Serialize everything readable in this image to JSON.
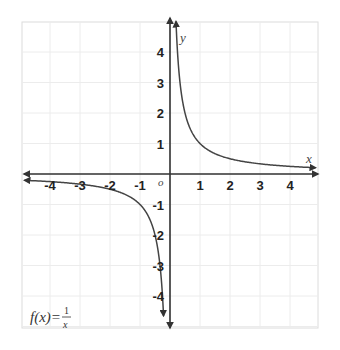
{
  "chart_data": {
    "type": "line",
    "title": "",
    "function_label": {
      "lhs": "f(x)=",
      "numerator": "1",
      "denominator": "x"
    },
    "xlabel": "x",
    "ylabel": "y",
    "origin_label": "o",
    "xlim": [
      -5,
      5
    ],
    "ylim": [
      -5,
      5
    ],
    "grid": true,
    "x_ticks": [
      -4,
      -3,
      -2,
      -1,
      1,
      2,
      3,
      4
    ],
    "y_ticks": [
      4,
      3,
      2,
      1,
      -1,
      -2,
      -3,
      -4
    ],
    "series": [
      {
        "name": "f(x)=1/x (x>0)",
        "x": [
          0.2,
          0.25,
          0.33,
          0.5,
          0.75,
          1,
          1.5,
          2,
          3,
          4,
          4.8
        ],
        "y": [
          5,
          4,
          3,
          2,
          1.33,
          1,
          0.67,
          0.5,
          0.33,
          0.25,
          0.21
        ]
      },
      {
        "name": "f(x)=1/x (x<0)",
        "x": [
          -4.8,
          -4,
          -3,
          -2,
          -1.5,
          -1,
          -0.75,
          -0.5,
          -0.33,
          -0.25,
          -0.2
        ],
        "y": [
          -0.21,
          -0.25,
          -0.33,
          -0.5,
          -0.67,
          -1,
          -1.33,
          -2,
          -3,
          -4,
          -5
        ]
      }
    ],
    "colors": {
      "curve": "#444444",
      "axis": "#333333",
      "grid": "#e6e6e6",
      "frame": "#dcdcdc"
    }
  }
}
